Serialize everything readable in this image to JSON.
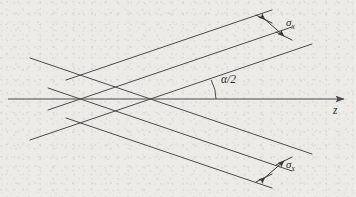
{
  "figure": {
    "kind": "optical-beam-crossing-diagram",
    "width": 356,
    "height": 197,
    "background_color": "#ecebe7",
    "line_color": "#4a4a4a",
    "text_color": "#2b2b2b"
  },
  "labels": {
    "sigma_top": {
      "symbol": "σ",
      "subscript": "x",
      "x": 283,
      "y": 22
    },
    "sigma_bottom": {
      "symbol": "σ",
      "subscript": "x",
      "x": 283,
      "y": 164
    },
    "angle": {
      "text": "α/2",
      "x": 219,
      "y": 79
    },
    "axis": {
      "text": "z",
      "x": 334,
      "y": 111
    }
  },
  "axis": {
    "name": "z-axis",
    "x1": 8,
    "y1": 99,
    "x2": 348,
    "y2": 99,
    "arrow": "right"
  },
  "crossing_point": {
    "x": 176,
    "y": 99
  },
  "beams": {
    "up_right": {
      "name": "upward-beam-bundle",
      "angle_deg": -28.5,
      "lines": [
        {
          "x1": 66,
          "y1": 80,
          "x2": 272,
          "y2": 10
        },
        {
          "x1": 48,
          "y1": 110,
          "x2": 292,
          "y2": 27
        },
        {
          "x1": 30,
          "y1": 140,
          "x2": 312,
          "y2": 44
        }
      ]
    },
    "down_right": {
      "name": "downward-beam-bundle",
      "angle_deg": 28.5,
      "lines": [
        {
          "x1": 30,
          "y1": 58,
          "x2": 312,
          "y2": 154
        },
        {
          "x1": 48,
          "y1": 88,
          "x2": 292,
          "y2": 171
        },
        {
          "x1": 66,
          "y1": 118,
          "x2": 272,
          "y2": 188
        }
      ]
    }
  },
  "measurements": {
    "top": {
      "name": "sigma-x-top-measure",
      "arrow_x1": 264,
      "arrow_y1": 19,
      "arrow_x2": 284,
      "arrow_y2": 36,
      "tick1_x1": 255,
      "tick1_y1": 15,
      "tick1_x2": 272,
      "tick1_y2": 23,
      "tick2_x1": 275,
      "tick2_y1": 32,
      "tick2_x2": 292,
      "tick2_y2": 40
    },
    "bottom": {
      "name": "sigma-x-bottom-measure",
      "arrow_x1": 264,
      "arrow_y1": 178,
      "arrow_x2": 284,
      "arrow_y2": 161,
      "tick1_x1": 255,
      "tick1_y1": 182,
      "tick1_x2": 272,
      "tick1_y2": 174,
      "tick2_x1": 275,
      "tick2_y1": 165,
      "tick2_x2": 292,
      "tick2_y2": 157
    }
  },
  "angle_arc": {
    "name": "alpha-half-arc",
    "center_x": 176,
    "center_y": 99,
    "radius": 40,
    "from_deg": 0,
    "to_deg": -28.5
  }
}
